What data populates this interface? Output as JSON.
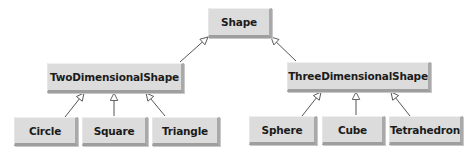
{
  "diagram": {
    "type": "uml-class-hierarchy",
    "colors": {
      "box_face": "#dcdcdc",
      "box_bevel": "#a9a9a9",
      "text": "#1b1b1b",
      "edge": "#555555",
      "arrowhead_fill": "#ffffff"
    },
    "nodes": {
      "shape": {
        "label": "Shape",
        "x": 208,
        "y": 8,
        "w": 64,
        "h": 30
      },
      "two_dimensional_shape": {
        "label": "TwoDimensionalShape",
        "x": 47,
        "y": 63,
        "w": 137,
        "h": 30
      },
      "three_dimensional_shape": {
        "label": "ThreeDimensionalShape",
        "x": 287,
        "y": 62,
        "w": 144,
        "h": 30
      },
      "circle": {
        "label": "Circle",
        "x": 14,
        "y": 117,
        "w": 64,
        "h": 29
      },
      "square": {
        "label": "Square",
        "x": 82,
        "y": 117,
        "w": 66,
        "h": 29
      },
      "triangle": {
        "label": "Triangle",
        "x": 152,
        "y": 117,
        "w": 68,
        "h": 29
      },
      "sphere": {
        "label": "Sphere",
        "x": 249,
        "y": 116,
        "w": 68,
        "h": 29
      },
      "cube": {
        "label": "Cube",
        "x": 322,
        "y": 116,
        "w": 63,
        "h": 29
      },
      "tetrahedron": {
        "label": "Tetrahedron",
        "x": 389,
        "y": 116,
        "w": 74,
        "h": 29
      }
    },
    "edges": [
      {
        "from": "TwoDimensionalShape",
        "to": "Shape",
        "relation": "generalization"
      },
      {
        "from": "ThreeDimensionalShape",
        "to": "Shape",
        "relation": "generalization"
      },
      {
        "from": "Circle",
        "to": "TwoDimensionalShape",
        "relation": "generalization"
      },
      {
        "from": "Square",
        "to": "TwoDimensionalShape",
        "relation": "generalization"
      },
      {
        "from": "Triangle",
        "to": "TwoDimensionalShape",
        "relation": "generalization"
      },
      {
        "from": "Sphere",
        "to": "ThreeDimensionalShape",
        "relation": "generalization"
      },
      {
        "from": "Cube",
        "to": "ThreeDimensionalShape",
        "relation": "generalization"
      },
      {
        "from": "Tetrahedron",
        "to": "ThreeDimensionalShape",
        "relation": "generalization"
      }
    ]
  }
}
